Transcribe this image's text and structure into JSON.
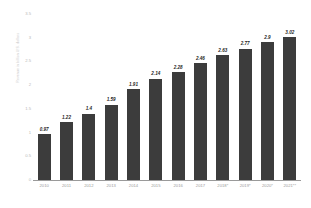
{
  "chart_data": {
    "type": "bar",
    "title": "",
    "subtitle": "",
    "xlabel": "",
    "ylabel": "Revenue in billion U.S. dollars",
    "ylim": [
      0,
      3.5
    ],
    "ytick_labels": [
      "3.5",
      "3",
      "2.5",
      "2",
      "1.5",
      "1",
      "0.5",
      "0"
    ],
    "ytick_values": [
      3.5,
      3,
      2.5,
      2,
      1.5,
      1,
      0.5,
      0
    ],
    "grid": false,
    "legend": null,
    "bar_color": "#3c3c3c",
    "categories": [
      "2010",
      "2011",
      "2012",
      "2013",
      "2014",
      "2015",
      "2016",
      "2017",
      "2018*",
      "2019*",
      "2020*",
      "2021**"
    ],
    "values": [
      0.97,
      1.22,
      1.4,
      1.59,
      1.91,
      2.14,
      2.28,
      2.46,
      2.63,
      2.77,
      2.9,
      3.02
    ],
    "value_labels": [
      "0.97",
      "1.22",
      "1.4",
      "1.59",
      "1.91",
      "2.14",
      "2.28",
      "2.46",
      "2.63",
      "2.77",
      "2.9",
      "3.02"
    ]
  }
}
